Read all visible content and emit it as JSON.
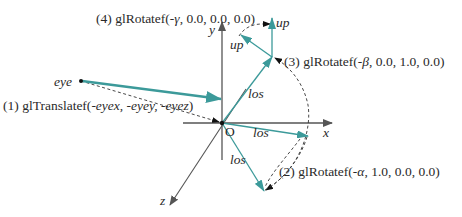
{
  "diagram": {
    "colors": {
      "axis": "#555555",
      "vector": "#3c9a9a",
      "dashed": "#333333",
      "text": "#2a2a2a"
    },
    "axes": {
      "x_label": "x",
      "y_label": "y",
      "z_label": "z",
      "origin_label": "O"
    },
    "points": {
      "eye_label": "eye"
    },
    "vectors": {
      "los_labels": [
        "los",
        "los",
        "los"
      ],
      "up_labels": [
        "up",
        "up"
      ]
    },
    "steps": [
      {
        "num": "(1)",
        "func": "glTranslatef(",
        "args": "-eyex, -eyey, -eyez",
        "close": ")"
      },
      {
        "num": "(2)",
        "func": "glRotatef(",
        "angle": "-α",
        "rest": ", 1.0, 0.0, 0.0)"
      },
      {
        "num": "(3)",
        "func": "glRotatef(",
        "angle": "-β",
        "rest": ", 0.0, 1.0, 0.0)"
      },
      {
        "num": "(4)",
        "func": "glRotatef(",
        "angle": "-γ",
        "rest": ", 0.0, 0.0, 0.0)"
      }
    ]
  }
}
